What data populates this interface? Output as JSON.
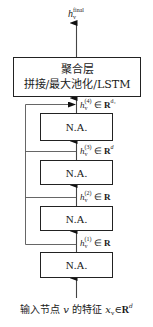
{
  "diagram": {
    "type": "jumping-knowledge-network",
    "output": {
      "symbol": "h",
      "subscript": "v",
      "superscript": "final"
    },
    "aggregation_layer": {
      "title": "聚合层",
      "subtitle": "拼接/最大池化/LSTM"
    },
    "layers": [
      {
        "label": "N.A.",
        "output": {
          "symbol": "h",
          "subscript": "v",
          "superscript": "(4)",
          "set": "R",
          "dim": "d₄"
        }
      },
      {
        "label": "N.A.",
        "output": {
          "symbol": "h",
          "subscript": "v",
          "superscript": "(3)",
          "set": "R",
          "dim": "d"
        }
      },
      {
        "label": "N.A.",
        "output": {
          "symbol": "h",
          "subscript": "v",
          "superscript": "(2)",
          "set": "R",
          "dim": ""
        }
      },
      {
        "label": "N.A.",
        "output": {
          "symbol": "h",
          "subscript": "v",
          "superscript": "(1)",
          "set": "R",
          "dim": ""
        }
      }
    ],
    "input": {
      "prefix": "输入节点",
      "node": "v",
      "middle": "的特征",
      "symbol": "x",
      "subscript": "v",
      "in": "∈",
      "set": "R",
      "dim": "d"
    },
    "colors": {
      "line": "#444444",
      "box_border": "#222222",
      "text": "#1a1a1a"
    }
  }
}
